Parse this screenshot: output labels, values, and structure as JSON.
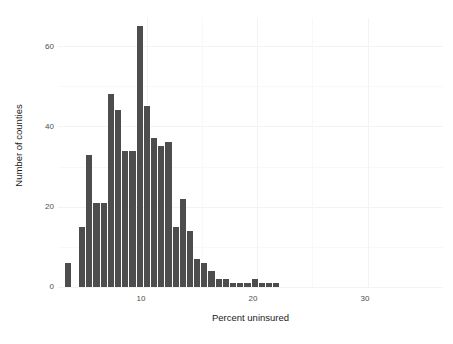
{
  "chart_data": {
    "type": "bar",
    "title": "",
    "subtitle": "",
    "xlabel": "Percent uninsured",
    "ylabel": "Number of counties",
    "xlim": [
      2.0,
      36.8
    ],
    "ylim": [
      0,
      67
    ],
    "xticks": [
      10,
      20,
      30
    ],
    "yticks": [
      0,
      20,
      40,
      60
    ],
    "grid": true,
    "legend": null,
    "bin_width": 0.65,
    "bin_starts": [
      2.6,
      3.25,
      3.9,
      4.55,
      5.2,
      5.85,
      6.5,
      7.15,
      7.8,
      8.45,
      9.1,
      9.75,
      10.4,
      11.05,
      11.7,
      12.35,
      13.0,
      13.65,
      14.3,
      14.95,
      15.6,
      16.25,
      16.9,
      17.55,
      18.2,
      18.85,
      19.5,
      20.15,
      20.8,
      21.45,
      22.1,
      22.75,
      23.4,
      24.05,
      24.7,
      25.35,
      26.0,
      26.65,
      27.3,
      29.25,
      29.9,
      30.55,
      32.5,
      34.45,
      35.1,
      35.75
    ],
    "categories": [
      "2.6",
      "3.25",
      "3.9",
      "4.55",
      "5.2",
      "5.85",
      "6.5",
      "7.15",
      "7.8",
      "8.45",
      "9.1",
      "9.75",
      "10.4",
      "11.05",
      "11.7",
      "12.35",
      "13",
      "13.65",
      "14.3",
      "14.95",
      "15.6",
      "16.25",
      "16.9",
      "17.55",
      "18.2",
      "18.85",
      "19.5",
      "20.15",
      "20.8",
      "21.45",
      "22.1",
      "22.75",
      "23.4",
      "24.05",
      "24.7",
      "25.35",
      "26",
      "26.65",
      "27.3",
      "29.25",
      "29.9",
      "30.55",
      "32.5",
      "34.45",
      "35.1",
      "35.75"
    ],
    "values": [
      6,
      0,
      15,
      33,
      21,
      0,
      48,
      44,
      34,
      0,
      65,
      45,
      37,
      35,
      36,
      0,
      15,
      22,
      14,
      7,
      6,
      4,
      2,
      2,
      1,
      1,
      0,
      0,
      1,
      2,
      0,
      1,
      0,
      1,
      1,
      0,
      0,
      0,
      0,
      0,
      0,
      0,
      0,
      0,
      0,
      0
    ],
    "bars": [
      {
        "x": 2.6,
        "height": 6
      },
      {
        "x": 3.9,
        "height": 15
      },
      {
        "x": 4.55,
        "height": 33
      },
      {
        "x": 5.2,
        "height": 21
      },
      {
        "x": 5.85,
        "height": 21
      },
      {
        "x": 6.5,
        "height": 48
      },
      {
        "x": 7.15,
        "height": 44
      },
      {
        "x": 7.8,
        "height": 34
      },
      {
        "x": 8.45,
        "height": 34
      },
      {
        "x": 9.1,
        "height": 65
      },
      {
        "x": 9.75,
        "height": 45
      },
      {
        "x": 10.4,
        "height": 37
      },
      {
        "x": 11.05,
        "height": 35
      },
      {
        "x": 11.7,
        "height": 36
      },
      {
        "x": 12.35,
        "height": 15
      },
      {
        "x": 13.0,
        "height": 22
      },
      {
        "x": 13.65,
        "height": 14
      },
      {
        "x": 14.3,
        "height": 7
      },
      {
        "x": 14.95,
        "height": 6
      },
      {
        "x": 15.6,
        "height": 4
      },
      {
        "x": 16.25,
        "height": 2
      },
      {
        "x": 16.9,
        "height": 2
      },
      {
        "x": 17.55,
        "height": 1
      },
      {
        "x": 18.2,
        "height": 1
      },
      {
        "x": 18.85,
        "height": 1
      },
      {
        "x": 19.5,
        "height": 2
      },
      {
        "x": 20.15,
        "height": 1
      },
      {
        "x": 20.8,
        "height": 1
      },
      {
        "x": 21.45,
        "height": 1
      }
    ],
    "bar_color": "#4d4d4d",
    "background_color": "#ffffff",
    "gridline_color": "#f3f3f3"
  },
  "axes": {
    "y_tick_labels": [
      "0",
      "20",
      "40",
      "60"
    ],
    "x_tick_labels": [
      "10",
      "20",
      "30"
    ],
    "x_axis_title": "Percent uninsured",
    "y_axis_title": "Number of counties"
  }
}
